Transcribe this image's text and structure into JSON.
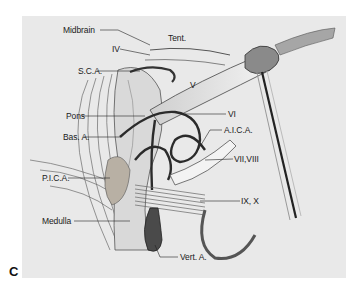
{
  "figure": {
    "panel_letter": "C",
    "background_color": "#e9e9e9",
    "labels": {
      "midbrain": "Midbrain",
      "tent": "Tent.",
      "iv": "IV",
      "sca": "S.C.A.",
      "v": "V",
      "pons": "Pons",
      "vi": "VI",
      "bas_a": "Bas. A.",
      "aica": "A.I.C.A.",
      "vii_viii": "VII,VIII",
      "pica": "P.I.C.A.",
      "ix_x": "IX, X",
      "medulla": "Medulla",
      "vert_a": "Vert. A."
    }
  }
}
